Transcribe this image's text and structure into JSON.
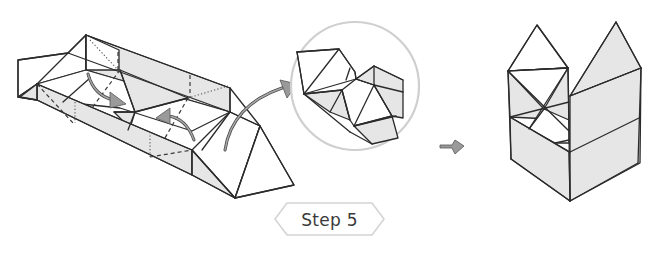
{
  "diagram": {
    "type": "origami-instruction",
    "step": {
      "label": "Step 5",
      "badge_stroke_color": "#d4d4d4",
      "text_color": "#3a3a3a"
    },
    "panels": [
      {
        "id": "folding-model",
        "description": "Elongated triangular-prism paper model with two inner flaps being folded toward the center",
        "annotations": [
          {
            "type": "fold-arrow",
            "direction": "down-right",
            "meaning": "fold left inner flap in"
          },
          {
            "type": "fold-arrow",
            "direction": "up-left",
            "meaning": "fold right inner flap in"
          },
          {
            "type": "callout-arrow",
            "direction": "up-right",
            "meaning": "points to zoomed detail"
          }
        ],
        "line_legend": {
          "dashed": "valley fold",
          "dotted": "mountain fold / hidden edge"
        }
      },
      {
        "id": "detail-inset",
        "description": "Circular magnified inset showing the interlocked folded flaps",
        "circle_color": "#cfcfcf"
      },
      {
        "id": "transition-arrow",
        "description": "Small gray arrow indicating the result",
        "direction": "right"
      },
      {
        "id": "result-model",
        "description": "Finished box-shaped model with two peaked triangular tops"
      }
    ],
    "colors": {
      "line": "#2b2b2b",
      "shade": "#e6e6e6",
      "arrow_fill": "#9a9a9a",
      "background": "#ffffff"
    }
  }
}
